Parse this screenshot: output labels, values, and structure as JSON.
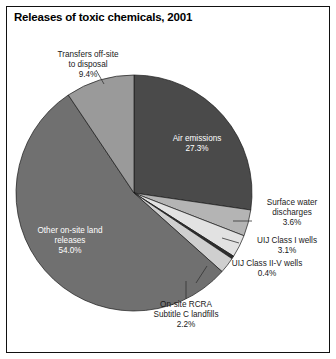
{
  "title": "Releases of toxic chemicals, 2001",
  "chart_data": {
    "type": "pie",
    "title": "Releases of toxic chemicals, 2001",
    "unit": "percent",
    "legend": "none",
    "start_angle_deg": 0,
    "direction": "clockwise",
    "categories": [
      "Air emissions",
      "Surface water discharges",
      "UIJ Class I wells",
      "UIJ Class II-V wells",
      "On-site RCRA Subtitle C landfills",
      "Other on-site land releases",
      "Transfers off-site to disposal"
    ],
    "values": [
      27.3,
      3.6,
      3.1,
      0.4,
      2.2,
      54.0,
      9.4
    ],
    "slices": [
      {
        "label": "Air emissions",
        "value": 27.3,
        "value_text": "27.3%",
        "color": "#4a4a4a",
        "label_placement": "inside",
        "label_color": "#ffffff"
      },
      {
        "label": "Surface water discharges",
        "value": 3.6,
        "value_text": "3.6%",
        "color": "#b4b4b4",
        "label_placement": "callout-right",
        "label_color": "#1a1a1a"
      },
      {
        "label": "UIJ Class I wells",
        "value": 3.1,
        "value_text": "3.1%",
        "color": "#e2e2e2",
        "label_placement": "callout-right",
        "label_color": "#1a1a1a"
      },
      {
        "label": "UIJ Class II-V wells",
        "value": 0.4,
        "value_text": "0.4%",
        "color": "#2e2e2e",
        "label_placement": "callout-right",
        "label_color": "#1a1a1a"
      },
      {
        "label": "On-site RCRA Subtitle C landfills",
        "value": 2.2,
        "value_text": "2.2%",
        "color": "#cfcfcf",
        "label_placement": "callout-bottom",
        "label_color": "#1a1a1a"
      },
      {
        "label": "Other on-site land releases",
        "value": 54.0,
        "value_text": "54.0%",
        "color": "#707070",
        "label_placement": "inside",
        "label_color": "#ffffff"
      },
      {
        "label": "Transfers off-site to disposal",
        "value": 9.4,
        "value_text": "9.4%",
        "color": "#9a9a9a",
        "label_placement": "callout-top",
        "label_color": "#1a1a1a"
      }
    ]
  },
  "labels": {
    "transfers_offsite": "Transfers off-site\nto disposal\n9.4%",
    "air_emissions": "Air emissions\n27.3%",
    "surface_water": "Surface water\ndischarges\n3.6%",
    "uij_class_i": "UIJ Class I wells\n3.1%",
    "uij_class_ii_v": "UIJ Class II-V wells\n0.4%",
    "onsite_rcra": "On-site RCRA\nSubtitle C landfills\n2.2%",
    "other_onsite": "Other on-site land\nreleases\n54.0%"
  }
}
